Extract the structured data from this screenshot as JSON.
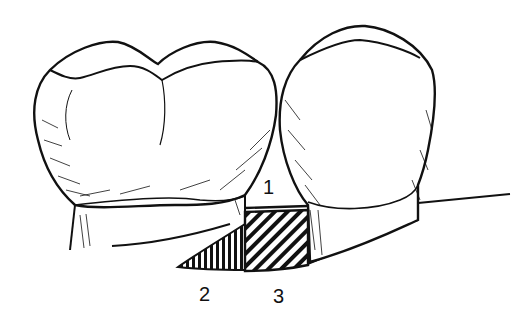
{
  "diagram": {
    "colors": {
      "ink": "#111111",
      "background": "#ffffff"
    },
    "labels": [
      {
        "id": "1",
        "text": "1",
        "x": 263,
        "y": 177
      },
      {
        "id": "2",
        "text": "2",
        "x": 199,
        "y": 284
      },
      {
        "id": "3",
        "text": "3",
        "x": 273,
        "y": 286
      }
    ],
    "elements": [
      {
        "name": "molar-tooth",
        "description": "Left tooth crown with two cusps"
      },
      {
        "name": "premolar-tooth",
        "description": "Right tooth crown"
      },
      {
        "name": "region-1",
        "description": "Blank space between teeth above bone"
      },
      {
        "name": "region-2",
        "description": "Vertically hatched triangular area"
      },
      {
        "name": "region-3",
        "description": "Diagonally hatched rectangular area"
      }
    ]
  }
}
